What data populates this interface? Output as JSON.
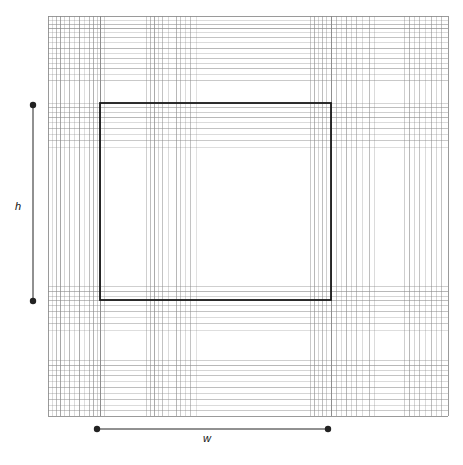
{
  "figure": {
    "title": "",
    "background_color": "#ffffff",
    "width": 463,
    "height": 465
  },
  "labels": {
    "height_label": "h",
    "width_label": "w"
  },
  "chart_data": {
    "type": "diagram",
    "title": "",
    "xlabel": "w",
    "ylabel": "h",
    "grid": true,
    "legend": "none",
    "colors": {
      "frame": "#555555",
      "grid_line": "#888888",
      "grid_line_light": "#bbbbbb",
      "highlight_rect": "#1a1a1a",
      "dimension": "#222222",
      "background": "#ffffff"
    },
    "frame": {
      "x": 48,
      "y": 16,
      "width": 400,
      "height": 400
    },
    "highlight_rect": {
      "x": 100,
      "y": 103,
      "width": 231,
      "height": 197
    },
    "vertical_lines": [
      {
        "x": 48,
        "opacity": 0.85,
        "width": 1
      },
      {
        "x": 52,
        "opacity": 0.3,
        "width": 1
      },
      {
        "x": 56,
        "opacity": 0.55,
        "width": 1
      },
      {
        "x": 60,
        "opacity": 0.75,
        "width": 1
      },
      {
        "x": 64,
        "opacity": 0.35,
        "width": 1
      },
      {
        "x": 69,
        "opacity": 0.6,
        "width": 1
      },
      {
        "x": 74,
        "opacity": 0.3,
        "width": 1
      },
      {
        "x": 79,
        "opacity": 0.7,
        "width": 1
      },
      {
        "x": 84,
        "opacity": 0.28,
        "width": 1
      },
      {
        "x": 89,
        "opacity": 0.55,
        "width": 1
      },
      {
        "x": 93,
        "opacity": 0.65,
        "width": 1
      },
      {
        "x": 97,
        "opacity": 0.4,
        "width": 1
      },
      {
        "x": 100,
        "opacity": 0.95,
        "width": 1
      },
      {
        "x": 104,
        "opacity": 0.35,
        "width": 1
      },
      {
        "x": 146,
        "opacity": 0.4,
        "width": 1
      },
      {
        "x": 150,
        "opacity": 0.55,
        "width": 1
      },
      {
        "x": 154,
        "opacity": 0.7,
        "width": 1
      },
      {
        "x": 158,
        "opacity": 0.35,
        "width": 1
      },
      {
        "x": 162,
        "opacity": 0.5,
        "width": 1
      },
      {
        "x": 168,
        "opacity": 0.3,
        "width": 1
      },
      {
        "x": 176,
        "opacity": 0.6,
        "width": 1
      },
      {
        "x": 180,
        "opacity": 0.45,
        "width": 1
      },
      {
        "x": 185,
        "opacity": 0.3,
        "width": 1
      },
      {
        "x": 190,
        "opacity": 0.5,
        "width": 1
      },
      {
        "x": 196,
        "opacity": 0.25,
        "width": 1
      },
      {
        "x": 310,
        "opacity": 0.45,
        "width": 1
      },
      {
        "x": 314,
        "opacity": 0.6,
        "width": 1
      },
      {
        "x": 318,
        "opacity": 0.35,
        "width": 1
      },
      {
        "x": 322,
        "opacity": 0.55,
        "width": 1
      },
      {
        "x": 326,
        "opacity": 0.4,
        "width": 1
      },
      {
        "x": 331,
        "opacity": 0.95,
        "width": 1
      },
      {
        "x": 336,
        "opacity": 0.5,
        "width": 1
      },
      {
        "x": 341,
        "opacity": 0.3,
        "width": 1
      },
      {
        "x": 346,
        "opacity": 0.6,
        "width": 1
      },
      {
        "x": 351,
        "opacity": 0.35,
        "width": 1
      },
      {
        "x": 356,
        "opacity": 0.5,
        "width": 1
      },
      {
        "x": 362,
        "opacity": 0.3,
        "width": 1
      },
      {
        "x": 369,
        "opacity": 0.55,
        "width": 1
      },
      {
        "x": 374,
        "opacity": 0.3,
        "width": 1
      },
      {
        "x": 404,
        "opacity": 0.4,
        "width": 1
      },
      {
        "x": 409,
        "opacity": 0.6,
        "width": 1
      },
      {
        "x": 414,
        "opacity": 0.35,
        "width": 1
      },
      {
        "x": 419,
        "opacity": 0.5,
        "width": 1
      },
      {
        "x": 425,
        "opacity": 0.3,
        "width": 1
      },
      {
        "x": 431,
        "opacity": 0.55,
        "width": 1
      },
      {
        "x": 436,
        "opacity": 0.35,
        "width": 1
      },
      {
        "x": 441,
        "opacity": 0.5,
        "width": 1
      },
      {
        "x": 448,
        "opacity": 0.85,
        "width": 1
      }
    ],
    "horizontal_lines": [
      {
        "y": 16,
        "opacity": 0.85,
        "width": 1
      },
      {
        "y": 20,
        "opacity": 0.3,
        "width": 1
      },
      {
        "y": 24,
        "opacity": 0.55,
        "width": 1
      },
      {
        "y": 28,
        "opacity": 0.7,
        "width": 1
      },
      {
        "y": 32,
        "opacity": 0.3,
        "width": 1
      },
      {
        "y": 37,
        "opacity": 0.5,
        "width": 1
      },
      {
        "y": 42,
        "opacity": 0.3,
        "width": 1
      },
      {
        "y": 48,
        "opacity": 0.6,
        "width": 1
      },
      {
        "y": 53,
        "opacity": 0.3,
        "width": 1
      },
      {
        "y": 58,
        "opacity": 0.5,
        "width": 1
      },
      {
        "y": 63,
        "opacity": 0.35,
        "width": 1
      },
      {
        "y": 68,
        "opacity": 0.55,
        "width": 1
      },
      {
        "y": 74,
        "opacity": 0.3,
        "width": 1
      },
      {
        "y": 80,
        "opacity": 0.45,
        "width": 1
      },
      {
        "y": 103,
        "opacity": 0.35,
        "width": 1
      },
      {
        "y": 107,
        "opacity": 0.55,
        "width": 1
      },
      {
        "y": 112,
        "opacity": 0.4,
        "width": 1
      },
      {
        "y": 117,
        "opacity": 0.6,
        "width": 1
      },
      {
        "y": 122,
        "opacity": 0.3,
        "width": 1
      },
      {
        "y": 128,
        "opacity": 0.5,
        "width": 1
      },
      {
        "y": 134,
        "opacity": 0.3,
        "width": 1
      },
      {
        "y": 140,
        "opacity": 0.45,
        "width": 1
      },
      {
        "y": 147,
        "opacity": 0.28,
        "width": 1
      },
      {
        "y": 286,
        "opacity": 0.4,
        "width": 1
      },
      {
        "y": 291,
        "opacity": 0.6,
        "width": 1
      },
      {
        "y": 296,
        "opacity": 0.35,
        "width": 1
      },
      {
        "y": 300,
        "opacity": 0.55,
        "width": 1
      },
      {
        "y": 305,
        "opacity": 0.4,
        "width": 1
      },
      {
        "y": 311,
        "opacity": 0.5,
        "width": 1
      },
      {
        "y": 317,
        "opacity": 0.3,
        "width": 1
      },
      {
        "y": 323,
        "opacity": 0.45,
        "width": 1
      },
      {
        "y": 330,
        "opacity": 0.28,
        "width": 1
      },
      {
        "y": 360,
        "opacity": 0.4,
        "width": 1
      },
      {
        "y": 365,
        "opacity": 0.6,
        "width": 1
      },
      {
        "y": 370,
        "opacity": 0.35,
        "width": 1
      },
      {
        "y": 375,
        "opacity": 0.5,
        "width": 1
      },
      {
        "y": 381,
        "opacity": 0.3,
        "width": 1
      },
      {
        "y": 387,
        "opacity": 0.55,
        "width": 1
      },
      {
        "y": 393,
        "opacity": 0.35,
        "width": 1
      },
      {
        "y": 399,
        "opacity": 0.5,
        "width": 1
      },
      {
        "y": 405,
        "opacity": 0.3,
        "width": 1
      },
      {
        "y": 410,
        "opacity": 0.45,
        "width": 1
      },
      {
        "y": 416,
        "opacity": 0.85,
        "width": 1
      }
    ],
    "dimension_bars": [
      {
        "name": "h",
        "orientation": "vertical",
        "x": 33,
        "y1": 105,
        "y2": 301,
        "endpoint_marker": "filled-circle"
      },
      {
        "name": "w",
        "orientation": "horizontal",
        "y": 429,
        "x1": 97,
        "x2": 328,
        "endpoint_marker": "filled-circle"
      }
    ]
  }
}
